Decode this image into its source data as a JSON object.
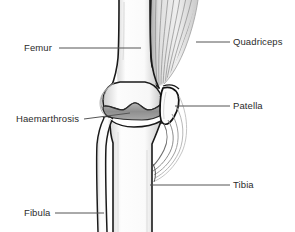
{
  "diagram": {
    "background_color": "#ffffff",
    "text_color": "#2b2b2b",
    "leader_line_color": "#555555",
    "bone_outline_color": "#1a1a1a",
    "bone_fill_color": "#fbfbfb",
    "effusion_fill_color": "#9a9a9a",
    "muscle_fill_color": "#e6e6e6",
    "muscle_stripe_color": "#8c8c8c"
  },
  "labels": {
    "left": [
      {
        "id": "femur",
        "text": "Femur"
      },
      {
        "id": "haemarthrosis",
        "text": "Haemarthrosis"
      },
      {
        "id": "fibula",
        "text": "Fibula"
      }
    ],
    "right": [
      {
        "id": "quadriceps",
        "text": "Quadriceps"
      },
      {
        "id": "patella",
        "text": "Patella"
      },
      {
        "id": "tibia",
        "text": "Tibia"
      }
    ]
  },
  "structures": [
    {
      "id": "femur",
      "name": "Femur",
      "side": "left"
    },
    {
      "id": "haemarthrosis",
      "name": "Haemarthrosis",
      "side": "left"
    },
    {
      "id": "fibula",
      "name": "Fibula",
      "side": "left"
    },
    {
      "id": "quadriceps",
      "name": "Quadriceps",
      "side": "right"
    },
    {
      "id": "patella",
      "name": "Patella",
      "side": "right"
    },
    {
      "id": "tibia",
      "name": "Tibia",
      "side": "right"
    }
  ]
}
